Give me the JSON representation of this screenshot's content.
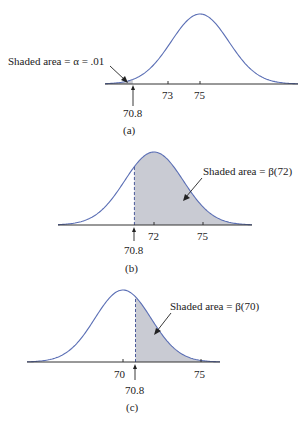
{
  "chart_data": [
    {
      "type": "area",
      "panel": "(a)",
      "description": "Normal curve centered at 75 with left-tail shaded region below 70.8",
      "distribution": {
        "mean": 75,
        "sd": 1.8
      },
      "ticks": [
        "73",
        "75"
      ],
      "critical_value": "70.8",
      "shaded_region": "x < 70.8",
      "annotation": "Shaded area = α = .01",
      "caption": "(a)"
    },
    {
      "type": "area",
      "panel": "(b)",
      "description": "Normal curve centered at 72 with region above 70.8 shaded",
      "distribution": {
        "mean": 72,
        "sd": 1.8
      },
      "ticks": [
        "72",
        "75"
      ],
      "critical_value": "70.8",
      "shaded_region": "x > 70.8",
      "annotation": "Shaded area = β(72)",
      "caption": "(b)"
    },
    {
      "type": "area",
      "panel": "(c)",
      "description": "Normal curve centered at 70 with region above 70.8 shaded",
      "distribution": {
        "mean": 70,
        "sd": 1.8
      },
      "ticks": [
        "70",
        "75"
      ],
      "critical_value": "70.8",
      "shaded_region": "x > 70.8",
      "annotation": "Shaded area = β(70)",
      "caption": "(c)"
    }
  ],
  "panels": {
    "a": {
      "annotation": "Shaded area = α = .01",
      "tick1": "73",
      "tick2": "75",
      "crit": "70.8",
      "caption": "(a)"
    },
    "b": {
      "annotation": "Shaded area = β(72)",
      "tick1": "72",
      "tick2": "75",
      "crit": "70.8",
      "caption": "(b)"
    },
    "c": {
      "annotation": "Shaded area = β(70)",
      "tick1": "70",
      "tick2": "75",
      "crit": "70.8",
      "caption": "(c)"
    }
  },
  "colors": {
    "curve": "#5b6fb5",
    "fill": "#c9cbd3",
    "axis": "#333333",
    "dash": "#4a5a9a"
  }
}
